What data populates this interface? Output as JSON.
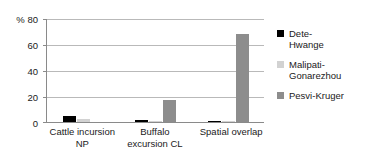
{
  "chart_data": {
    "type": "bar",
    "title": "",
    "subtitle": "",
    "xlabel": "",
    "ylabel": "%",
    "ylim": [
      0,
      80
    ],
    "yticks": [
      0,
      20,
      40,
      60,
      80
    ],
    "ytick_labels": [
      "0",
      "20",
      "40",
      "60",
      "80"
    ],
    "y_axis_unit_label": "%",
    "y_top_label": "% 80",
    "grid": true,
    "grid_axis": "y",
    "legend_position": "right",
    "categories": [
      "Cattle incursion\nNP",
      "Buffalo\nexcursion CL",
      "Spatial overlap"
    ],
    "category_labels_flat": [
      "Cattle incursion NP",
      "Buffalo excursion CL",
      "Spatial overlap"
    ],
    "series": [
      {
        "name": "Dete-\nHwange",
        "name_flat": "Dete-Hwange",
        "color": "#000000",
        "values": [
          5.0,
          1.5,
          0.5
        ]
      },
      {
        "name": "Malipati-\nGonarezhou",
        "name_flat": "Malipati-Gonarezhou",
        "color": "#d2d2d2",
        "values": [
          2.0,
          0.8,
          1.0
        ]
      },
      {
        "name": "Pesvi-Kruger",
        "name_flat": "Pesvi-Kruger",
        "color": "#8d8d8d",
        "values": [
          0.0,
          17.0,
          68.0
        ]
      }
    ]
  },
  "colors": {
    "axis": "#8a8a8a",
    "grid": "#b9b9b9",
    "text": "#1a1a1a",
    "background": "#ffffff",
    "series_0": "#000000",
    "series_1": "#d2d2d2",
    "series_2": "#8d8d8d"
  }
}
